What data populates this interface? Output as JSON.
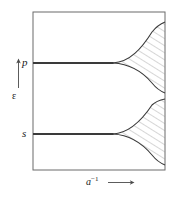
{
  "figure": {
    "type": "energy-band-diagram"
  },
  "axes": {
    "y": {
      "label": "ε",
      "arrow": "up",
      "arrow_icon": "arrow-up-icon"
    },
    "x": {
      "label_base": "a",
      "label_exponent": "−1",
      "arrow": "right",
      "arrow_icon": "arrow-right-icon"
    }
  },
  "levels": [
    {
      "id": "p",
      "label": "p",
      "y": 63
    },
    {
      "id": "s",
      "label": "s",
      "y": 134
    }
  ],
  "bands": [
    {
      "id": "p-band",
      "level_label": "p",
      "split_x": 113,
      "split_y": 63,
      "top_right_y": 22,
      "bottom_right_y": 93,
      "right_x": 165,
      "hatched": true
    },
    {
      "id": "s-band",
      "level_label": "s",
      "split_x": 113,
      "split_y": 134,
      "top_right_y": 99,
      "bottom_right_y": 165,
      "right_x": 165,
      "hatched": true
    }
  ],
  "frame": {
    "left": 33,
    "top": 12,
    "right": 165,
    "bottom": 170
  },
  "colors": {
    "line": "#3a3a3a",
    "frame": "#6b6b6b",
    "hatch": "#8a8a8a",
    "background": "#ffffff",
    "text": "#1a1a1a"
  }
}
